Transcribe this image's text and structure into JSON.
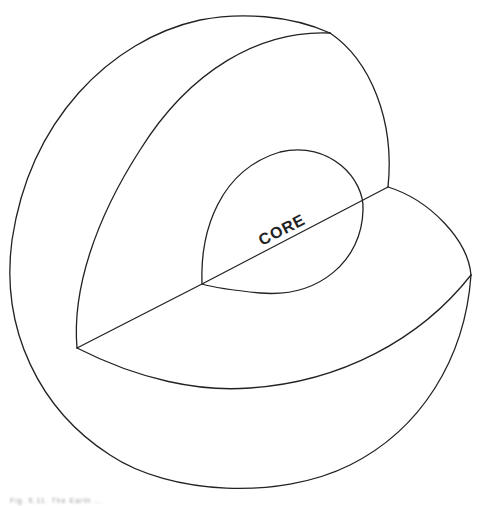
{
  "diagram": {
    "type": "cutaway sphere",
    "labels": {
      "core": "CORE"
    },
    "stroke_color": "#222222",
    "background": "#ffffff"
  },
  "caption": {
    "text": "Fig. 5.11. The Earth ..."
  }
}
